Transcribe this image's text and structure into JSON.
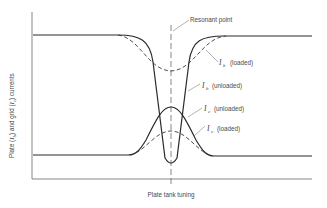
{
  "diagram": {
    "y_axis_label_parts": [
      "Plate (",
      "I",
      "b",
      ") and grid (",
      "I",
      "c",
      ") currents"
    ],
    "x_axis_label": "Plate tank tuning",
    "resonant_label": "Resonant point",
    "curves": [
      {
        "id": "ib-loaded",
        "symbol": "I",
        "subscript": "b",
        "qualifier": "(loaded)",
        "style": "dashed"
      },
      {
        "id": "ib-unloaded",
        "symbol": "I",
        "subscript": "b",
        "qualifier": "(unloaded)",
        "style": "solid"
      },
      {
        "id": "ic-unloaded",
        "symbol": "I",
        "subscript": "c",
        "qualifier": "(unloaded)",
        "style": "solid"
      },
      {
        "id": "ic-loaded",
        "symbol": "I",
        "subscript": "c",
        "qualifier": "(loaded)",
        "style": "dashed"
      }
    ]
  }
}
